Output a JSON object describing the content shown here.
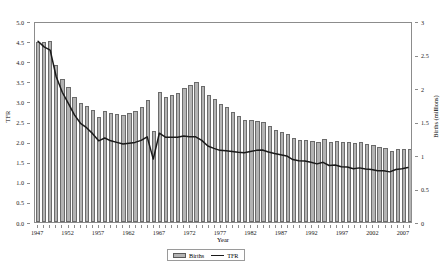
{
  "chart_data": {
    "type": "bar",
    "title": "",
    "xlabel": "Year",
    "ylabel": "TFR",
    "y2label": "Births (millions)",
    "grid": false,
    "legend_position": "bottom-center",
    "ylim": [
      0.0,
      5.0
    ],
    "y2lim": [
      0,
      3
    ],
    "ytick_labels": [
      "5.0",
      "4.5",
      "4.0",
      "3.5",
      "3.0",
      "2.5",
      "2.0",
      "1.5",
      "1.0",
      "0.5",
      "0.0"
    ],
    "ytick_values": [
      5.0,
      4.5,
      4.0,
      3.5,
      3.0,
      2.5,
      2.0,
      1.5,
      1.0,
      0.5,
      0.0
    ],
    "y2tick_labels": [
      "3",
      "2.5",
      "2",
      "1.5",
      "1",
      "0.5",
      "0"
    ],
    "y2tick_values": [
      3,
      2.5,
      2,
      1.5,
      1,
      0.5,
      0
    ],
    "xtick_labels": [
      "1947",
      "1952",
      "1957",
      "1962",
      "1967",
      "1972",
      "1977",
      "1982",
      "1987",
      "1992",
      "1997",
      "2002",
      "2007"
    ],
    "xtick_values": [
      1947,
      1952,
      1957,
      1962,
      1967,
      1972,
      1977,
      1982,
      1987,
      1992,
      1997,
      2002,
      2007
    ],
    "legend": [
      {
        "name": "Births",
        "kind": "bar",
        "color": "#b3b3b3"
      },
      {
        "name": "TFR",
        "kind": "line",
        "color": "#1a1a1a"
      }
    ],
    "categories": [
      1947,
      1948,
      1949,
      1950,
      1951,
      1952,
      1953,
      1954,
      1955,
      1956,
      1957,
      1958,
      1959,
      1960,
      1961,
      1962,
      1963,
      1964,
      1965,
      1966,
      1967,
      1968,
      1969,
      1970,
      1971,
      1972,
      1973,
      1974,
      1975,
      1976,
      1977,
      1978,
      1979,
      1980,
      1981,
      1982,
      1983,
      1984,
      1985,
      1986,
      1987,
      1988,
      1989,
      1990,
      1991,
      1992,
      1993,
      1994,
      1995,
      1996,
      1997,
      1998,
      1999,
      2000,
      2001,
      2002,
      2003,
      2004,
      2005,
      2006,
      2007,
      2008
    ],
    "series": [
      {
        "name": "Births",
        "axis": "right",
        "unit": "millions",
        "values": [
          2.68,
          2.68,
          2.7,
          2.34,
          2.14,
          2.01,
          1.87,
          1.77,
          1.73,
          1.67,
          1.57,
          1.65,
          1.63,
          1.61,
          1.59,
          1.62,
          1.66,
          1.72,
          1.82,
          1.36,
          1.94,
          1.87,
          1.89,
          1.93,
          2.0,
          2.04,
          2.09,
          2.03,
          1.9,
          1.83,
          1.76,
          1.71,
          1.64,
          1.58,
          1.53,
          1.52,
          1.51,
          1.49,
          1.43,
          1.38,
          1.35,
          1.31,
          1.25,
          1.22,
          1.22,
          1.21,
          1.19,
          1.24,
          1.19,
          1.21,
          1.19,
          1.2,
          1.18,
          1.19,
          1.17,
          1.15,
          1.12,
          1.11,
          1.06,
          1.09,
          1.09,
          1.09
        ]
      },
      {
        "name": "TFR",
        "axis": "left",
        "unit": "children per woman",
        "values": [
          4.54,
          4.4,
          4.32,
          3.65,
          3.26,
          2.98,
          2.69,
          2.48,
          2.37,
          2.22,
          2.04,
          2.11,
          2.04,
          2.0,
          1.96,
          1.98,
          2.0,
          2.05,
          2.14,
          1.58,
          2.23,
          2.13,
          2.13,
          2.13,
          2.16,
          2.14,
          2.14,
          2.05,
          1.91,
          1.85,
          1.8,
          1.79,
          1.77,
          1.75,
          1.74,
          1.77,
          1.8,
          1.81,
          1.76,
          1.72,
          1.69,
          1.66,
          1.57,
          1.54,
          1.53,
          1.5,
          1.46,
          1.5,
          1.42,
          1.43,
          1.39,
          1.38,
          1.34,
          1.36,
          1.33,
          1.32,
          1.29,
          1.29,
          1.26,
          1.32,
          1.34,
          1.37
        ]
      }
    ]
  }
}
